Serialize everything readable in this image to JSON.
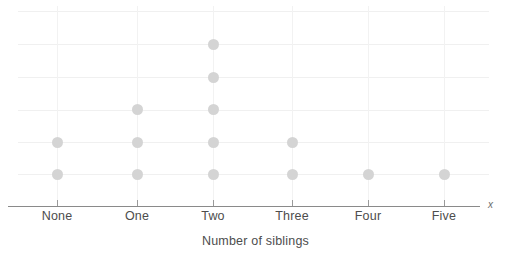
{
  "chart_data": {
    "type": "dot-plot",
    "title": "",
    "xlabel": "Number of siblings",
    "ylabel": "",
    "axis_marker": "x",
    "categories": [
      "None",
      "One",
      "Two",
      "Three",
      "Four",
      "Five"
    ],
    "values": [
      2,
      3,
      5,
      2,
      1,
      1
    ],
    "grid": {
      "horizontal": true,
      "vertical": true,
      "horizontal_levels": 6,
      "gridline_color": "#f0f0f0"
    },
    "legend": null,
    "dot_color": "#d4d4d4",
    "axis_color": "#8a8a8a",
    "text_color": "#4d4d4d"
  },
  "layout": {
    "geometry": {
      "category_x": [
        57,
        137,
        213,
        292,
        368,
        444
      ],
      "row_y": [
        174,
        142,
        109,
        77,
        44
      ],
      "gridline_y": [
        11,
        44,
        77,
        110,
        142,
        174
      ],
      "axis_y": 206,
      "axis_left": 8,
      "axis_right": 480,
      "grid_left": 18,
      "grid_right": 489,
      "grid_top": 6
    }
  }
}
